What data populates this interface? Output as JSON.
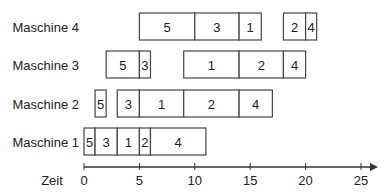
{
  "chart_data": {
    "type": "gantt",
    "title": "",
    "xlabel": "Zeit",
    "ylabel": "",
    "xlim": [
      0,
      25
    ],
    "xticks": [
      0,
      5,
      10,
      15,
      20,
      25
    ],
    "tick_labels": [
      "0",
      "5",
      "10",
      "15",
      "20",
      "25"
    ],
    "grid": false,
    "legend": "none",
    "rows": [
      {
        "name": "Maschine 4",
        "tasks": [
          {
            "job": "5",
            "start": 5,
            "end": 10
          },
          {
            "job": "3",
            "start": 10,
            "end": 14
          },
          {
            "job": "1",
            "start": 14,
            "end": 16
          },
          {
            "job": "2",
            "start": 18,
            "end": 20
          },
          {
            "job": "4",
            "start": 20,
            "end": 21
          }
        ]
      },
      {
        "name": "Maschine 3",
        "tasks": [
          {
            "job": "5",
            "start": 2,
            "end": 5
          },
          {
            "job": "3",
            "start": 5,
            "end": 6
          },
          {
            "job": "1",
            "start": 9,
            "end": 14
          },
          {
            "job": "2",
            "start": 14,
            "end": 18
          },
          {
            "job": "4",
            "start": 18,
            "end": 20
          }
        ]
      },
      {
        "name": "Maschine 2",
        "tasks": [
          {
            "job": "5",
            "start": 1,
            "end": 2
          },
          {
            "job": "3",
            "start": 3,
            "end": 5
          },
          {
            "job": "1",
            "start": 5,
            "end": 9
          },
          {
            "job": "2",
            "start": 9,
            "end": 14
          },
          {
            "job": "4",
            "start": 14,
            "end": 17
          }
        ]
      },
      {
        "name": "Maschine 1",
        "tasks": [
          {
            "job": "5",
            "start": 0,
            "end": 1
          },
          {
            "job": "3",
            "start": 1,
            "end": 3
          },
          {
            "job": "1",
            "start": 3,
            "end": 5
          },
          {
            "job": "2",
            "start": 5,
            "end": 6
          },
          {
            "job": "4",
            "start": 6,
            "end": 11
          }
        ]
      }
    ],
    "colors": {
      "bar_fill": "#ffffff",
      "bar_stroke": "#444444",
      "axis": "#333333",
      "text": "#222222"
    }
  }
}
